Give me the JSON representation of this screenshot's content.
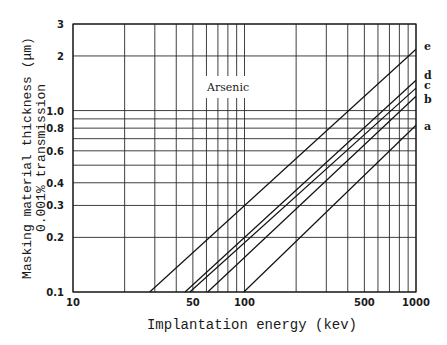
{
  "chart_data": {
    "type": "line",
    "title": "",
    "annotation": "Arsenic",
    "xlabel": "Implantation energy (kev)",
    "ylabel_line1": "Masking material thickness (μm)",
    "ylabel_line2": "0.001% transmission",
    "xscale": "log",
    "yscale": "log",
    "xlim": [
      10,
      1000
    ],
    "ylim": [
      0.1,
      3
    ],
    "grid": true,
    "x_tick_labels": [
      {
        "value": 10,
        "label": "10"
      },
      {
        "value": 50,
        "label": "50"
      },
      {
        "value": 100,
        "label": "100"
      },
      {
        "value": 500,
        "label": "500"
      },
      {
        "value": 1000,
        "label": "1000"
      }
    ],
    "y_tick_labels": [
      {
        "value": 0.1,
        "label": "0.1"
      },
      {
        "value": 0.2,
        "label": "0.2"
      },
      {
        "value": 0.3,
        "label": "0.3"
      },
      {
        "value": 0.4,
        "label": "0.4"
      },
      {
        "value": 0.6,
        "label": "0.6"
      },
      {
        "value": 0.8,
        "label": "0.8"
      },
      {
        "value": 1.0,
        "label": "1.0"
      },
      {
        "value": 2,
        "label": "2"
      },
      {
        "value": 3,
        "label": "3"
      }
    ],
    "x_gridlines": [
      10,
      20,
      30,
      40,
      50,
      60,
      70,
      80,
      90,
      100,
      200,
      300,
      400,
      500,
      600,
      700,
      800,
      900,
      1000
    ],
    "y_gridlines": [
      0.1,
      0.2,
      0.3,
      0.4,
      0.5,
      0.6,
      0.7,
      0.8,
      0.9,
      1.0,
      2,
      3
    ],
    "series": [
      {
        "name": "a",
        "x": [
          99,
          1000
        ],
        "y": [
          0.1,
          0.83
        ]
      },
      {
        "name": "b",
        "x": [
          61,
          1000
        ],
        "y": [
          0.1,
          1.2
        ]
      },
      {
        "name": "c",
        "x": [
          48,
          1000
        ],
        "y": [
          0.1,
          1.33
        ]
      },
      {
        "name": "d",
        "x": [
          45,
          1000
        ],
        "y": [
          0.1,
          1.47
        ]
      },
      {
        "name": "e",
        "x": [
          28,
          1000
        ],
        "y": [
          0.1,
          2.18
        ]
      }
    ],
    "legend_position": "right-edge labels"
  }
}
